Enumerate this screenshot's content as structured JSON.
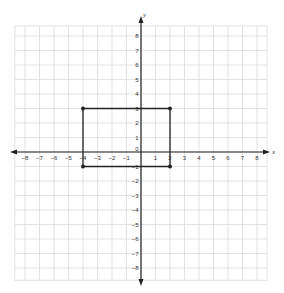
{
  "graph": {
    "type": "coordinate-plane",
    "x_axis": {
      "label": "x",
      "min": -8,
      "max": 8,
      "ticks": [
        "-8",
        "-7",
        "-6",
        "-5",
        "-4",
        "-3",
        "-2",
        "-1",
        "1",
        "2",
        "3",
        "4",
        "5",
        "6",
        "7",
        "8"
      ]
    },
    "y_axis": {
      "label": "y",
      "min": -8,
      "max": 8,
      "ticks": [
        "8",
        "7",
        "6",
        "5",
        "4",
        "3",
        "2",
        "1",
        "-1",
        "-2",
        "-3",
        "-4",
        "-5",
        "-6",
        "-7",
        "-8"
      ]
    },
    "origin_label": "0",
    "grid": true,
    "colors": {
      "grid": "#dcdcdc",
      "axis": "#222222",
      "shape": "#222222",
      "background": "#ffffff"
    }
  },
  "shape": {
    "type": "rectangle",
    "vertices": [
      [
        -4,
        3
      ],
      [
        2,
        3
      ],
      [
        2,
        -1
      ],
      [
        -4,
        -1
      ]
    ]
  }
}
